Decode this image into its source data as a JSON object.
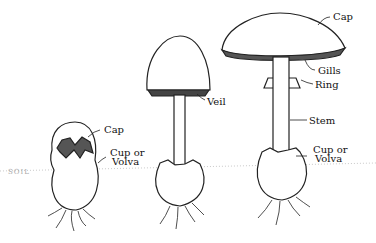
{
  "diagram": {
    "soil_label": "SOIL",
    "stages": [
      {
        "name": "button",
        "labels": {
          "cap": "Cap",
          "cup1": "Cup or",
          "cup2": "Volva"
        }
      },
      {
        "name": "young",
        "labels": {
          "veil": "Veil"
        }
      },
      {
        "name": "mature",
        "labels": {
          "cap": "Cap",
          "gills": "Gills",
          "ring": "Ring",
          "stem": "Stem",
          "cup1": "Cup or",
          "cup2": "Volva"
        }
      }
    ]
  }
}
